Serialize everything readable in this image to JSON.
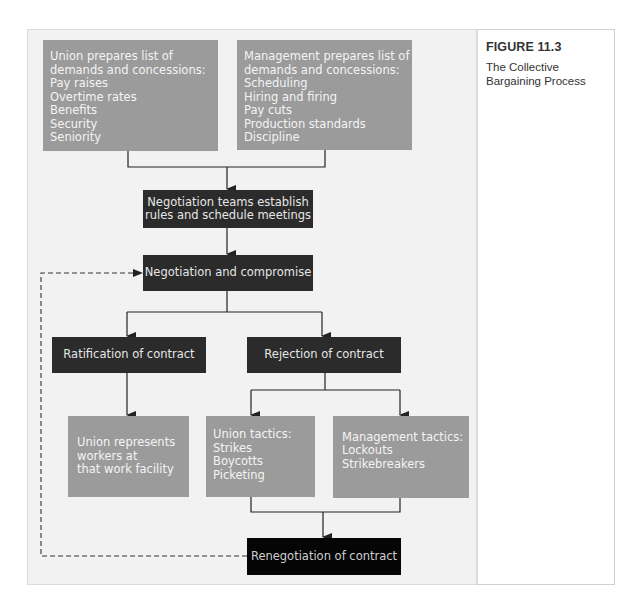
{
  "figure": {
    "label": "FIGURE 11.3",
    "title_lines": [
      "The Collective",
      "Bargaining Process"
    ]
  },
  "nodes": {
    "union_prepares": {
      "lines": [
        "Union prepares list of",
        "demands and concessions:",
        "Pay raises",
        "Overtime rates",
        "Benefits",
        "Security",
        "Seniority"
      ]
    },
    "management_prepares": {
      "lines": [
        "Management prepares list of",
        "demands and concessions:",
        "Scheduling",
        "Hiring and firing",
        "Pay cuts",
        "Production standards",
        "Discipline"
      ]
    },
    "negotiation_teams": {
      "lines": [
        "Negotiation teams establish",
        "rules and schedule meetings"
      ]
    },
    "negotiation_compromise": {
      "label": "Negotiation and compromise"
    },
    "ratification": {
      "label": "Ratification of contract"
    },
    "rejection": {
      "label": "Rejection of contract"
    },
    "union_represents": {
      "lines": [
        "Union represents",
        "workers at",
        "that work facility"
      ]
    },
    "union_tactics": {
      "lines": [
        "Union tactics:",
        "Strikes",
        "Boycotts",
        "Picketing"
      ]
    },
    "management_tactics": {
      "lines": [
        "Management tactics:",
        "Lockouts",
        "Strikebreakers"
      ]
    },
    "renegotiation": {
      "label": "Renegotiation of contract"
    }
  },
  "colors": {
    "panel_bg": "#f2f2f2",
    "gray_box": "#9b9b9b",
    "dark_box": "#2b2b2b",
    "black_box": "#050505",
    "connector": "#222222"
  }
}
